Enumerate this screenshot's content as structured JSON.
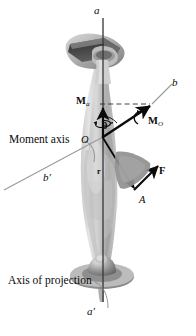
{
  "figure": {
    "background": "#ffffff",
    "width": 196,
    "height": 336
  },
  "colors": {
    "ink": "#0a0a0a",
    "axis_line": "#3c3c3c",
    "leader_gray": "#8f8f8f",
    "body_light": "#d6d6d6",
    "body_mid": "#b4b4b4",
    "body_dark": "#8c8c8c",
    "metal_dark": "#4a4a4a",
    "base_gray": "#a8a8a8"
  },
  "labels": {
    "axis_top": "a",
    "axis_bottom": "a′",
    "moment_axis_top": "b",
    "moment_axis_bottom": "b′",
    "moment_component": "M",
    "moment_component_sub": "a",
    "moment_resultant": "M",
    "moment_resultant_sub": "O",
    "angle": "θ",
    "origin": "O",
    "position_vector": "r",
    "force": "F",
    "point": "A",
    "moment_axis_caption": "Moment axis",
    "projection_axis_caption": "Axis of projection"
  },
  "vectors": [
    {
      "name": "M-a",
      "label": "M_a",
      "from": [
        103,
        137
      ],
      "to": [
        103,
        106
      ],
      "style": "bold-arrow",
      "meaning": "moment component along axis a-a'"
    },
    {
      "name": "M-O",
      "label": "M_O",
      "from": [
        103,
        137
      ],
      "to": [
        152,
        104
      ],
      "style": "bold-arrow-double-head",
      "meaning": "resultant moment about point O"
    },
    {
      "name": "r",
      "label": "r",
      "from": [
        103,
        137
      ],
      "to": [
        135,
        188
      ],
      "style": "bold-arrow",
      "meaning": "position vector from O to A"
    },
    {
      "name": "F",
      "label": "F",
      "from": [
        134,
        190
      ],
      "to": [
        159,
        165
      ],
      "style": "bold-arrow",
      "meaning": "applied force at A"
    }
  ],
  "axes": [
    {
      "name": "axis-of-projection",
      "label_top": "a",
      "label_bottom": "a′",
      "orientation": "vertical",
      "x": 103,
      "y_top": 18,
      "y_bottom": 302
    },
    {
      "name": "moment-axis",
      "label_top": "b",
      "label_bottom": "b′",
      "orientation": "oblique",
      "from": [
        4,
        190
      ],
      "to": [
        170,
        80
      ]
    }
  ],
  "annotations": [
    {
      "name": "angle-theta",
      "text": "θ",
      "between": [
        "M-a",
        "M-O"
      ]
    },
    {
      "name": "curved-spin-arrow",
      "meaning": "rotation sense about axis a-a'"
    },
    {
      "name": "dashed-projection-line",
      "meaning": "projection of M_O onto axis a-a'"
    }
  ]
}
